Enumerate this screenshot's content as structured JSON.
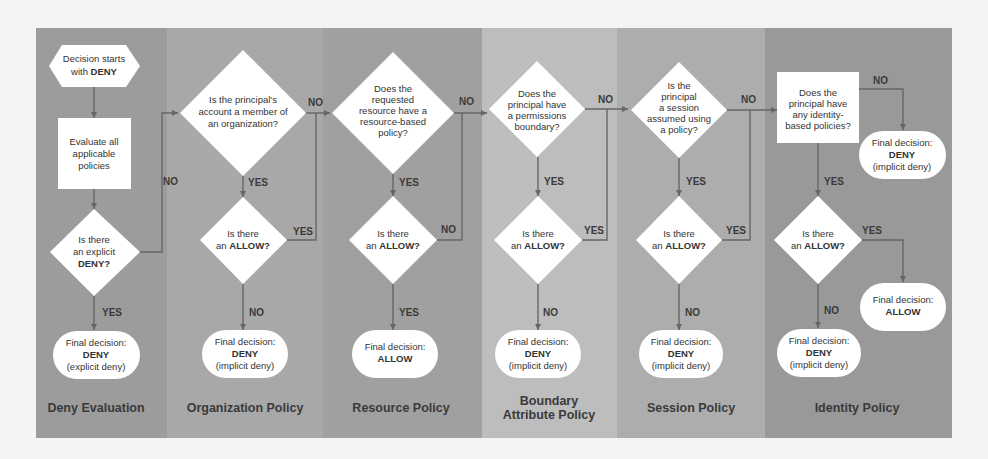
{
  "colors": {
    "page_bg": "#f4f4f2",
    "col_dark": "#9a9a9a",
    "col_mid": "#a9a9a9",
    "col_light": "#bfbfbf",
    "shape": "#ffffff",
    "line": "#666666"
  },
  "columns": [
    {
      "title": "Deny Evaluation"
    },
    {
      "title": "Organization Policy"
    },
    {
      "title": "Resource Policy"
    },
    {
      "title_line1": "Boundary",
      "title_line2": "Attribute Policy"
    },
    {
      "title": "Session Policy"
    },
    {
      "title": "Identity Policy"
    }
  ],
  "deny": {
    "start_l1": "Decision starts",
    "start_l2a": "with ",
    "start_l2b": "DENY",
    "eval_l1": "Evaluate all",
    "eval_l2": "applicable",
    "eval_l3": "policies",
    "q_l1": "Is there",
    "q_l2": "an explicit",
    "q_l3": "DENY?",
    "yes": "YES",
    "no": "NO",
    "final_l1": "Final decision:",
    "final_l2": "DENY",
    "final_l3": "(explicit deny)"
  },
  "org": {
    "q_l1": "Is the principal's",
    "q_l2": "account a member of",
    "q_l3": "an organization?",
    "no": "NO",
    "yes": "YES",
    "allow_l1": "Is there",
    "allow_l2a": "an ",
    "allow_l2b": "ALLOW?",
    "allow_yes": "YES",
    "allow_no": "NO",
    "final_l1": "Final decision:",
    "final_l2": "DENY",
    "final_l3": "(implicit deny)"
  },
  "resource": {
    "q_l1": "Does the",
    "q_l2": "requested",
    "q_l3": "resource have a",
    "q_l4": "resource-based",
    "q_l5": "policy?",
    "no": "NO",
    "yes": "YES",
    "allow_l1": "Is there",
    "allow_l2a": "an ",
    "allow_l2b": "ALLOW?",
    "allow_no": "NO",
    "allow_yes": "YES",
    "final_l1": "Final decision:",
    "final_l2": "ALLOW"
  },
  "boundary": {
    "q_l1": "Does the",
    "q_l2": "principal have",
    "q_l3": "a permissions",
    "q_l4": "boundary?",
    "no": "NO",
    "yes": "YES",
    "allow_l1": "Is there",
    "allow_l2a": "an ",
    "allow_l2b": "ALLOW?",
    "allow_yes": "YES",
    "allow_no": "NO",
    "final_l1": "Final decision:",
    "final_l2": "DENY",
    "final_l3": "(implicit deny)"
  },
  "session": {
    "q_l1": "Is the",
    "q_l2": "principal",
    "q_l3": "a session",
    "q_l4": "assumed using",
    "q_l5": "a policy?",
    "no": "NO",
    "yes": "YES",
    "allow_l1": "Is there",
    "allow_l2a": "an ",
    "allow_l2b": "ALLOW?",
    "allow_yes": "YES",
    "allow_no": "NO",
    "final_l1": "Final decision:",
    "final_l2": "DENY",
    "final_l3": "(implicit deny)"
  },
  "identity": {
    "q_l1": "Does the",
    "q_l2": "principal have",
    "q_l3": "any identity-",
    "q_l4": "based policies?",
    "no": "NO",
    "yes": "YES",
    "no_final_l1": "Final decision:",
    "no_final_l2": "DENY",
    "no_final_l3": "(implicit deny)",
    "allow_l1": "Is there",
    "allow_l2a": "an ",
    "allow_l2b": "ALLOW?",
    "allow_yes": "YES",
    "allow_no": "NO",
    "allow_final_l1": "Final decision:",
    "allow_final_l2": "ALLOW",
    "final_l1": "Final decision:",
    "final_l2": "DENY",
    "final_l3": "(implicit deny)"
  }
}
